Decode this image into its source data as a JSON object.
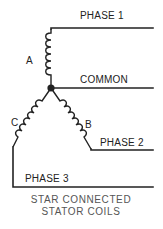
{
  "diagram": {
    "type": "electrical-schematic",
    "labels": {
      "phase1": "PHASE 1",
      "common": "COMMON",
      "phase2": "PHASE 2",
      "phase3": "PHASE 3",
      "coil_a": "A",
      "coil_b": "B",
      "coil_c": "C"
    },
    "caption": {
      "line1": "STAR CONNECTED",
      "line2": "STATOR COILS"
    },
    "colors": {
      "line": "#222222",
      "caption": "#555555",
      "background": "#ffffff"
    }
  }
}
